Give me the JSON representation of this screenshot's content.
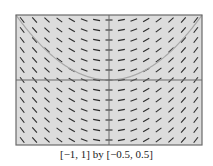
{
  "caption": "[−1, 1] by [−0.5, 0.5]",
  "colors": {
    "background": "#ffffff",
    "plot_background": "#dcdcdc",
    "frame": "#6a6a6a",
    "axes": "#6a6a6a",
    "segments": "#2a2a2a",
    "curve": "#a8a8a8"
  },
  "chart_data": {
    "type": "slope_field",
    "title": "",
    "differential_equation": "dy/dx = x",
    "xlim": [
      -1,
      1
    ],
    "ylim": [
      -0.5,
      0.5
    ],
    "window_caption": "[−1, 1] by [−0.5, 0.5]",
    "grid_columns": 15,
    "grid_rows": 13,
    "grid": false,
    "axes_drawn": true,
    "solution_curve": {
      "equation": "y = x^2/2",
      "vertex": [
        0,
        0
      ]
    },
    "xlabel": "",
    "ylabel": ""
  }
}
